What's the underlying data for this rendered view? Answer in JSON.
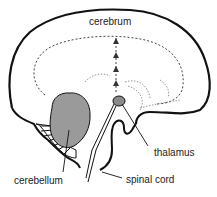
{
  "diagram": {
    "type": "anatomical-illustration",
    "labels": {
      "cerebrum": "cerebrum",
      "thalamus": "thalamus",
      "cerebellum": "cerebellum",
      "spinal_cord": "spinal cord"
    },
    "colors": {
      "outline": "#111111",
      "cerebellum_fill": "#9a9a9a",
      "thalamus_fill": "#8a8a8a",
      "dashed": "#444444",
      "label_text": "#222222"
    }
  }
}
